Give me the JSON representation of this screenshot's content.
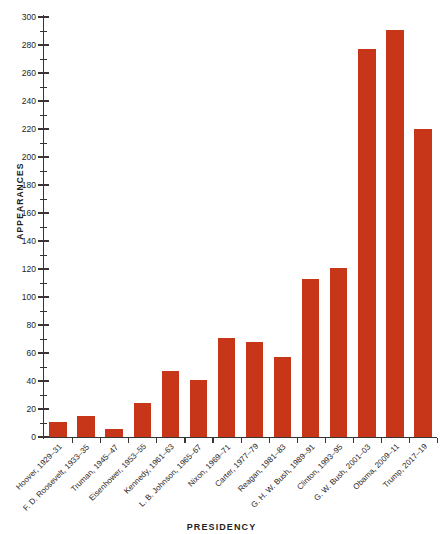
{
  "chart_data": {
    "type": "bar",
    "title": "",
    "xlabel": "PRESIDENCY",
    "ylabel": "APPEARANCES",
    "ylim": [
      0,
      300
    ],
    "ytick_step": 20,
    "yminor_step": 10,
    "grid": false,
    "legend": null,
    "bar_color": "#c8361a",
    "categories": [
      "Hoover, 1929–31",
      "F. D. Roosevelt, 1933–35",
      "Truman, 1945–47",
      "Eisenhower, 1953–55",
      "Kennedy, 1961–63",
      "L. B. Johnson, 1965–67",
      "Nixon, 1969–71",
      "Carter, 1977–79",
      "Reagan, 1981–83",
      "G. H. W. Bush, 1989–91",
      "Clinton, 1993–95",
      "G. W. Bush, 2001–03",
      "Obama, 2009–11",
      "Trump, 2017–19"
    ],
    "values": [
      11,
      15,
      6,
      24,
      47,
      41,
      71,
      68,
      57,
      113,
      121,
      277,
      291,
      220
    ],
    "ytick_labels": [
      "0",
      "20",
      "40",
      "60",
      "80",
      "100",
      "120",
      "140",
      "160",
      "180",
      "200",
      "220",
      "240",
      "260",
      "280",
      "300"
    ],
    "ytick_values": [
      0,
      20,
      40,
      60,
      80,
      100,
      120,
      140,
      160,
      180,
      200,
      220,
      240,
      260,
      280,
      300
    ]
  }
}
